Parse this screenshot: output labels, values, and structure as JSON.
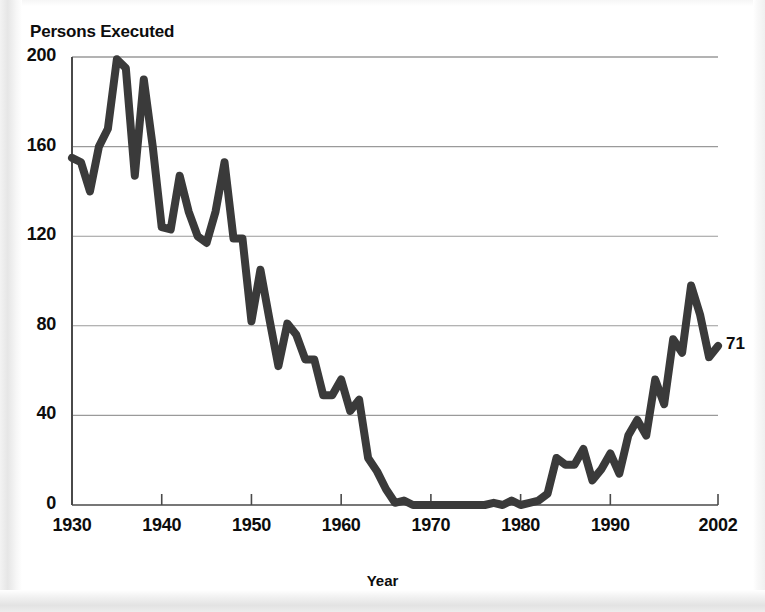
{
  "chart_data": {
    "type": "line",
    "title": "Persons Executed",
    "xlabel": "Year",
    "ylabel": "Persons Executed",
    "xlim": [
      1930,
      2002
    ],
    "ylim": [
      0,
      200
    ],
    "grid": true,
    "legend": null,
    "line_color": "#3a3a3a",
    "gridline_color": "#9a9a9a",
    "xticks": [
      1930,
      1940,
      1950,
      1960,
      1970,
      1980,
      1990,
      2002
    ],
    "xtick_labels": [
      "1930",
      "1940",
      "1950",
      "1960",
      "1970",
      "1980",
      "1990",
      "2002"
    ],
    "yticks": [
      0,
      40,
      80,
      120,
      160,
      200
    ],
    "ytick_labels": [
      "0",
      "40",
      "80",
      "120",
      "160",
      "200"
    ],
    "annotations": [
      {
        "text": "71",
        "x": 2002,
        "y": 71
      }
    ],
    "x": [
      1930,
      1931,
      1932,
      1933,
      1934,
      1935,
      1936,
      1937,
      1938,
      1939,
      1940,
      1941,
      1942,
      1943,
      1944,
      1945,
      1946,
      1947,
      1948,
      1949,
      1950,
      1951,
      1952,
      1953,
      1954,
      1955,
      1956,
      1957,
      1958,
      1959,
      1960,
      1961,
      1962,
      1963,
      1964,
      1965,
      1966,
      1967,
      1968,
      1969,
      1970,
      1971,
      1972,
      1973,
      1974,
      1975,
      1976,
      1977,
      1978,
      1979,
      1980,
      1981,
      1982,
      1983,
      1984,
      1985,
      1986,
      1987,
      1988,
      1989,
      1990,
      1991,
      1992,
      1993,
      1994,
      1995,
      1996,
      1997,
      1998,
      1999,
      2000,
      2001,
      2002
    ],
    "values": [
      155,
      153,
      140,
      160,
      168,
      199,
      195,
      147,
      190,
      160,
      124,
      123,
      147,
      131,
      120,
      117,
      131,
      153,
      119,
      119,
      82,
      105,
      83,
      62,
      81,
      76,
      65,
      65,
      49,
      49,
      56,
      42,
      47,
      21,
      15,
      7,
      1,
      2,
      0,
      0,
      0,
      0,
      0,
      0,
      0,
      0,
      0,
      1,
      0,
      2,
      0,
      1,
      2,
      5,
      21,
      18,
      18,
      25,
      11,
      16,
      23,
      14,
      31,
      38,
      31,
      56,
      45,
      74,
      68,
      98,
      85,
      66,
      71
    ]
  }
}
